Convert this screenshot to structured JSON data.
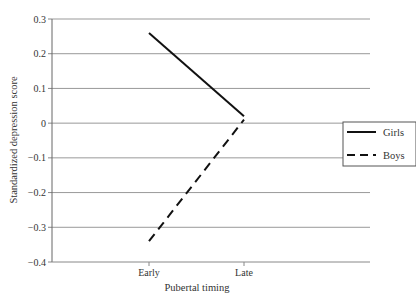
{
  "chart_data": {
    "type": "line",
    "title": "",
    "xlabel": "Pubertal timing",
    "ylabel": "Standardized depression score",
    "categories": [
      "Early",
      "Late"
    ],
    "series": [
      {
        "name": "Girls",
        "values": [
          0.26,
          0.02
        ],
        "style": "solid"
      },
      {
        "name": "Boys",
        "values": [
          -0.34,
          0.01
        ],
        "style": "dashed"
      }
    ],
    "ylim": [
      -0.4,
      0.3
    ],
    "yticks": [
      0.3,
      0.2,
      0.1,
      0,
      -0.1,
      -0.2,
      -0.3,
      -0.4
    ],
    "ytick_labels": [
      "0.3",
      "0.2",
      "0.1",
      "0",
      "−0.1",
      "−0.2",
      "−0.3",
      "−0.4"
    ],
    "grid": true,
    "legend_position": "right"
  },
  "legend": {
    "girls_label": "Girls",
    "boys_label": "Boys"
  },
  "axes": {
    "xlabel": "Pubertal timing",
    "ylabel": "Standardized depression score",
    "x_early": "Early",
    "x_late": "Late"
  }
}
